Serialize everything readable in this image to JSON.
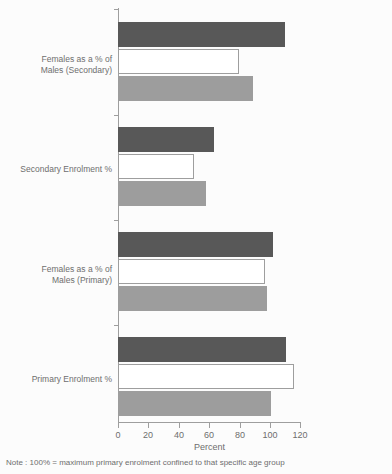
{
  "chart_data": {
    "type": "bar",
    "orientation": "horizontal",
    "title": "",
    "xlabel": "Percent",
    "ylabel": "",
    "xlim": [
      0,
      120
    ],
    "xticks": [
      0,
      20,
      40,
      60,
      80,
      100,
      120
    ],
    "xticklabels": [
      "0",
      "20",
      "40",
      "60",
      "80",
      "100",
      "120"
    ],
    "grid": false,
    "legend": null,
    "note": "Note : 100% = maximum primary enrolment confined to that specific age group",
    "categories": [
      "Primary Enrolment %",
      "Females as a % of Males (Primary)",
      "Secondary Enrolment %",
      "Females as a % of Males (Secondary)"
    ],
    "series": [
      {
        "name": "series-1",
        "color": "#585858",
        "values": [
          111,
          102,
          63,
          110
        ]
      },
      {
        "name": "series-2",
        "color": "#ffffff",
        "values": [
          116,
          97,
          50,
          80
        ]
      },
      {
        "name": "series-3",
        "color": "#9d9d9d",
        "values": [
          101,
          98,
          58,
          89
        ]
      }
    ]
  },
  "axis": {
    "x_title": "Percent",
    "tick_labels": [
      "0",
      "20",
      "40",
      "60",
      "80",
      "100",
      "120"
    ]
  },
  "labels": {
    "cat_0": "Primary Enrolment %",
    "cat_1_line_1": "Females as a % of",
    "cat_1_line_2": "Males (Primary)",
    "cat_2": "Secondary Enrolment %",
    "cat_3_line_1": "Females as a % of",
    "cat_3_line_2": "Males (Secondary)"
  },
  "footer": {
    "note": "Note : 100% = maximum primary enrolment confined to that specific age group"
  },
  "colors": {
    "series_1": "#585858",
    "series_2": "#ffffff",
    "series_3": "#9d9d9d",
    "axis": "#9e9e9e",
    "text": "#6e6e6e",
    "background": "#fcfcfc"
  }
}
